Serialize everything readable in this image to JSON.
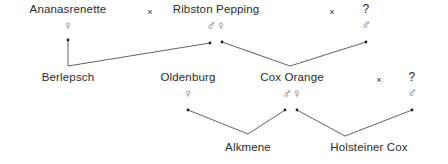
{
  "diagram": {
    "line_color": "#3a3a3a",
    "text_color": "#2b2b2b",
    "symbol_color": "#6b6b6b",
    "background": "#ffffff",
    "cross_symbol": "×",
    "symbols": {
      "male": "♂",
      "female": "♀",
      "unknown_label": "?"
    },
    "nodes": [
      {
        "id": "ananasrenette",
        "label": "Ananasrenette",
        "sexes": [
          "♀"
        ]
      },
      {
        "id": "ribston",
        "label": "Ribston Pepping",
        "sexes": [
          "♂",
          "♀"
        ]
      },
      {
        "id": "unknown-top",
        "label": "?",
        "sexes": [
          "♂"
        ]
      },
      {
        "id": "berlepsch",
        "label": "Berlepsch",
        "sexes": []
      },
      {
        "id": "oldenburg",
        "label": "Oldenburg",
        "sexes": [
          "♀"
        ]
      },
      {
        "id": "cox-orange",
        "label": "Cox Orange",
        "sexes": [
          "♂",
          "♀"
        ]
      },
      {
        "id": "unknown-mid",
        "label": "?",
        "sexes": [
          "♂"
        ]
      },
      {
        "id": "alkmene",
        "label": "Alkmene",
        "sexes": []
      },
      {
        "id": "holsteiner-cox",
        "label": "Holsteiner Cox",
        "sexes": []
      }
    ],
    "crosses": [
      {
        "id": "cross-top-left",
        "label": "×"
      },
      {
        "id": "cross-top-right",
        "label": "×"
      },
      {
        "id": "cross-mid-right",
        "label": "×"
      }
    ],
    "edges": [
      {
        "from": "ananasrenette",
        "to": "berlepsch"
      },
      {
        "from": "ribston",
        "to": "berlepsch"
      },
      {
        "from": "ribston",
        "to": "cox-orange"
      },
      {
        "from": "unknown-top",
        "to": "cox-orange"
      },
      {
        "from": "oldenburg",
        "to": "alkmene"
      },
      {
        "from": "cox-orange",
        "to": "alkmene"
      },
      {
        "from": "cox-orange",
        "to": "holsteiner-cox"
      },
      {
        "from": "unknown-mid",
        "to": "holsteiner-cox"
      }
    ]
  }
}
